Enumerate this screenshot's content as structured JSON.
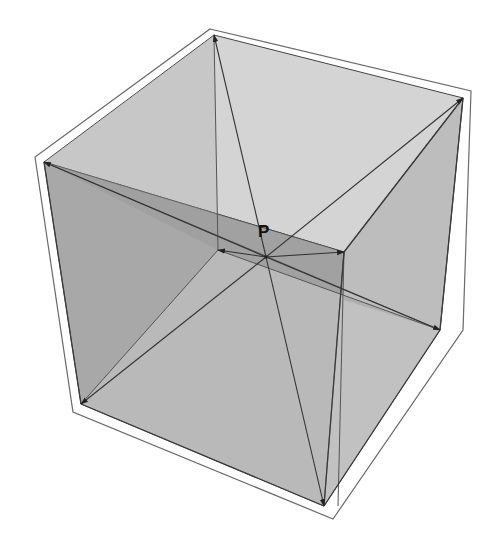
{
  "diagram": {
    "title": "",
    "type": "3D cube with diagonals from interior point",
    "point_label": "P",
    "colors": {
      "background": "#ffffff",
      "frame_stroke": "#6a6a6a",
      "frame_fill": "#ffffff",
      "face_top": "#d2d2d2",
      "face_left": "#a9a9a9",
      "face_right": "#b4b4b4",
      "face_bottom": "#c3c3c3",
      "face_back_band": "#9a9a9a",
      "line": "#3a3a3a",
      "arrow": "#222222",
      "label": "#111111"
    },
    "point_P": {
      "x": 266,
      "y": 257
    },
    "vertices": {
      "top_back": {
        "x": 214,
        "y": 35
      },
      "top_right": {
        "x": 463,
        "y": 98
      },
      "top_left": {
        "x": 44,
        "y": 162
      },
      "top_front": {
        "x": 344,
        "y": 252
      },
      "bottom_back": {
        "x": 218,
        "y": 250
      },
      "bottom_right": {
        "x": 440,
        "y": 330
      },
      "bottom_left": {
        "x": 81,
        "y": 404
      },
      "bottom_front": {
        "x": 324,
        "y": 506
      }
    },
    "arrows_from_P_to": [
      "top_back",
      "top_right",
      "top_left",
      "top_front",
      "bottom_back",
      "bottom_right",
      "bottom_left",
      "bottom_front"
    ]
  }
}
